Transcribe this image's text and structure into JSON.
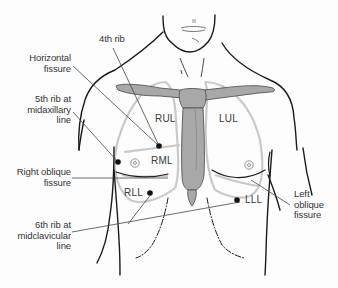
{
  "diagram": {
    "colors": {
      "outline": "#1a1a1a",
      "lung_outline": "#c8c8c8",
      "bone_fill": "#a8a8a8",
      "bone_stroke": "#555555",
      "leader": "#444444",
      "text": "#333333",
      "dot": "#111111"
    },
    "callouts_left": [
      {
        "id": "fourth-rib",
        "text": "4th rib"
      },
      {
        "id": "horizontal-fissure",
        "text": "Horizontal\nfissure"
      },
      {
        "id": "fifth-rib-midaxillary",
        "text": "5th rib at\nmidaxillary\nline"
      },
      {
        "id": "right-oblique-fissure",
        "text": "Right oblique\nfissure"
      },
      {
        "id": "sixth-rib-midclavicular",
        "text": "6th rib at\nmidclavicular\nline"
      }
    ],
    "callouts_right": [
      {
        "id": "left-oblique-fissure",
        "text": "Left\noblique\nfissure"
      }
    ],
    "lobes": [
      {
        "id": "rul",
        "text": "RUL"
      },
      {
        "id": "rml",
        "text": "RML"
      },
      {
        "id": "rll",
        "text": "RLL"
      },
      {
        "id": "lul",
        "text": "LUL"
      },
      {
        "id": "lll",
        "text": "LLL"
      }
    ]
  }
}
